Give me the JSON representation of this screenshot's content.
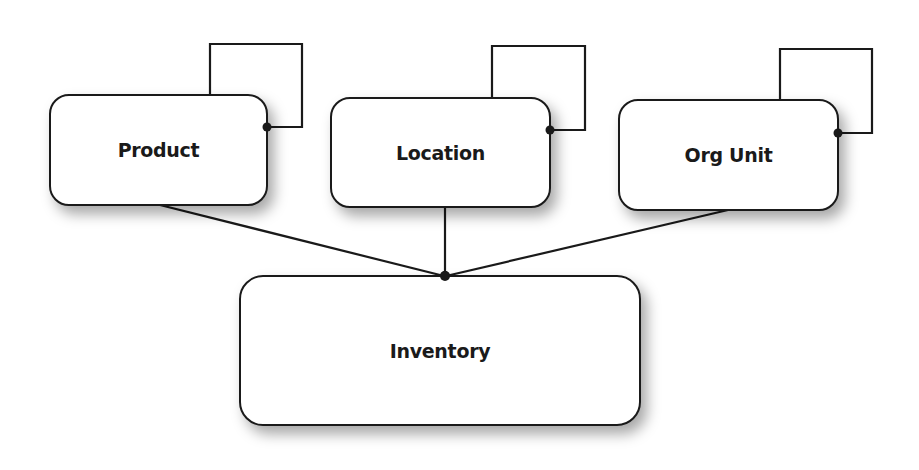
{
  "diagram": {
    "type": "entity-relationship",
    "entities": [
      {
        "id": "product",
        "label": "Product"
      },
      {
        "id": "location",
        "label": "Location"
      },
      {
        "id": "org_unit",
        "label": "Org Unit"
      },
      {
        "id": "inventory",
        "label": "Inventory"
      }
    ],
    "relationships": [
      {
        "from": "product",
        "to": "inventory"
      },
      {
        "from": "location",
        "to": "inventory"
      },
      {
        "from": "org_unit",
        "to": "inventory"
      }
    ],
    "self_relationships": [
      "product",
      "location",
      "org_unit"
    ]
  }
}
